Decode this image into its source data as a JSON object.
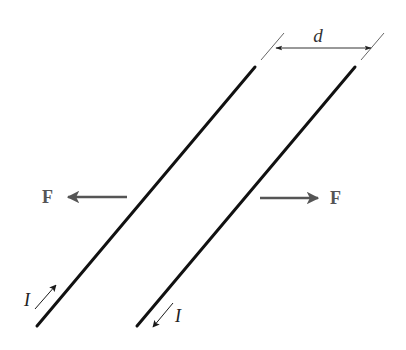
{
  "diagram": {
    "type": "parallel-wires-force",
    "labels": {
      "separation": "d",
      "force_left": "F",
      "force_right": "F",
      "current_left": "I",
      "current_right": "I"
    },
    "wires": [
      {
        "name": "left-wire",
        "current_direction": "up-right"
      },
      {
        "name": "right-wire",
        "current_direction": "down-left"
      }
    ],
    "forces": [
      {
        "name": "force-left",
        "direction": "left"
      },
      {
        "name": "force-right",
        "direction": "right"
      }
    ],
    "colors": {
      "wire": "#111111",
      "force_arrow": "#555555",
      "label": "#555555",
      "dimension": "#333333",
      "current_arrow": "#222222"
    }
  }
}
